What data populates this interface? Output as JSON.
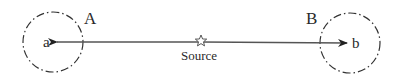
{
  "diagram": {
    "regions": [
      {
        "id": "A",
        "label": "A",
        "point_label": "a",
        "cx": 53,
        "cy": 42,
        "r": 30
      },
      {
        "id": "B",
        "label": "B",
        "point_label": "b",
        "cx": 350,
        "cy": 43,
        "r": 30
      }
    ],
    "source": {
      "label": "Source",
      "x": 201,
      "y": 40
    },
    "arrow": {
      "from": "Source",
      "to_left": "a",
      "to_right": "b",
      "bidirectional": true
    },
    "colors": {
      "stroke": "#333333",
      "line": "#555555",
      "text": "#2a2a2a"
    }
  }
}
